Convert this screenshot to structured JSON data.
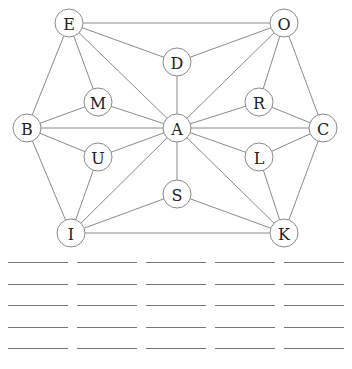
{
  "puzzle": {
    "nodes": [
      {
        "id": "E",
        "label": "E",
        "x": 69,
        "y": 23
      },
      {
        "id": "O",
        "label": "O",
        "x": 284,
        "y": 23
      },
      {
        "id": "D",
        "label": "D",
        "x": 177,
        "y": 62
      },
      {
        "id": "M",
        "label": "M",
        "x": 98,
        "y": 102
      },
      {
        "id": "R",
        "label": "R",
        "x": 259,
        "y": 102
      },
      {
        "id": "B",
        "label": "B",
        "x": 27,
        "y": 128
      },
      {
        "id": "A",
        "label": "A",
        "x": 177,
        "y": 128
      },
      {
        "id": "C",
        "label": "C",
        "x": 323,
        "y": 128
      },
      {
        "id": "U",
        "label": "U",
        "x": 98,
        "y": 157
      },
      {
        "id": "L",
        "label": "L",
        "x": 259,
        "y": 157
      },
      {
        "id": "S",
        "label": "S",
        "x": 177,
        "y": 194
      },
      {
        "id": "I",
        "label": "I",
        "x": 71,
        "y": 233
      },
      {
        "id": "K",
        "label": "K",
        "x": 284,
        "y": 233
      }
    ],
    "edges": [
      [
        "E",
        "O"
      ],
      [
        "E",
        "D"
      ],
      [
        "E",
        "M"
      ],
      [
        "E",
        "B"
      ],
      [
        "E",
        "A"
      ],
      [
        "O",
        "D"
      ],
      [
        "O",
        "R"
      ],
      [
        "O",
        "C"
      ],
      [
        "O",
        "A"
      ],
      [
        "D",
        "A"
      ],
      [
        "M",
        "B"
      ],
      [
        "M",
        "A"
      ],
      [
        "R",
        "A"
      ],
      [
        "R",
        "C"
      ],
      [
        "B",
        "A"
      ],
      [
        "B",
        "U"
      ],
      [
        "B",
        "I"
      ],
      [
        "A",
        "C"
      ],
      [
        "A",
        "U"
      ],
      [
        "A",
        "L"
      ],
      [
        "A",
        "S"
      ],
      [
        "A",
        "I"
      ],
      [
        "A",
        "K"
      ],
      [
        "C",
        "L"
      ],
      [
        "C",
        "K"
      ],
      [
        "U",
        "I"
      ],
      [
        "L",
        "K"
      ],
      [
        "S",
        "I"
      ],
      [
        "S",
        "K"
      ],
      [
        "I",
        "K"
      ]
    ],
    "node_radius": 14
  },
  "answer_blanks": {
    "rows": 5,
    "columns": 5
  }
}
